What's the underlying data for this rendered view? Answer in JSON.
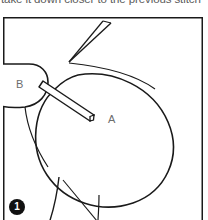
{
  "caption": {
    "text": "take it down closer to the previous stitch"
  },
  "figure": {
    "frame_color": "#1a1a1a",
    "line_color": "#1a1a1a",
    "label_color": "#6d6d6d",
    "labels": [
      {
        "id": "A",
        "text": "A",
        "x": 105,
        "y": 106
      },
      {
        "id": "B",
        "text": "B",
        "x": 13,
        "y": 71
      }
    ]
  },
  "step_badge": {
    "number": "1",
    "background": "#111111",
    "text_color": "#ffffff"
  }
}
